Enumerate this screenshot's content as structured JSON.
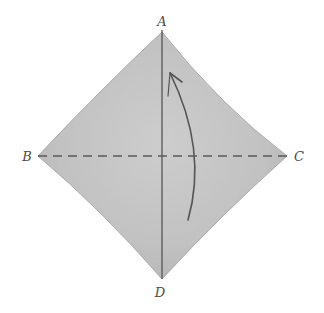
{
  "diagram": {
    "type": "origami-fold-diagram",
    "shape": "square-diamond",
    "fill_color": "#c4c4c4",
    "line_color": "#4a4a4a",
    "vertices": {
      "A": {
        "label": "A",
        "x": 162,
        "y": 32
      },
      "B": {
        "label": "B",
        "x": 38,
        "y": 156
      },
      "C": {
        "label": "C",
        "x": 287,
        "y": 156
      },
      "D": {
        "label": "D",
        "x": 162,
        "y": 279
      }
    },
    "lines": [
      {
        "name": "vertical-crease",
        "from": "A",
        "to": "D",
        "style": "solid"
      },
      {
        "name": "horizontal-fold-line",
        "from": "B",
        "to": "C",
        "style": "dashed"
      }
    ],
    "arrow": {
      "type": "curved",
      "direction": "up",
      "description": "fold bottom half up along B-C"
    },
    "labels": {
      "a": "A",
      "b": "B",
      "c": "C",
      "d": "D"
    }
  }
}
